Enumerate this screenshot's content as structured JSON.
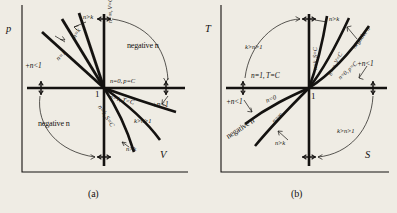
{
  "figure": {
    "background_color": "#efece4",
    "ink_color": "#141210"
  },
  "panels": [
    {
      "id": "a",
      "caption": "(a)",
      "y_axis_label": "p",
      "x_axis_label": "V",
      "origin_label": "1",
      "labels": [
        {
          "key": "n_gt_k_top",
          "text": "n>k"
        },
        {
          "key": "n_eq_k_upper",
          "text": "n=k"
        },
        {
          "key": "n_eq_1_upper",
          "text": "n=1"
        },
        {
          "key": "plus_n_lt_1_l",
          "text": "+n<1"
        },
        {
          "key": "v_axis_line",
          "text": "n=∞, V=C"
        },
        {
          "key": "negative_n_ur",
          "text": "negative n"
        },
        {
          "key": "n_eq_0",
          "text": "n=0, p=C"
        },
        {
          "key": "n_eq_1_lower",
          "text": "n=1, T=C"
        },
        {
          "key": "plus_n_lt_1_r",
          "text": "+n<1"
        },
        {
          "key": "k_gt_n_gt_1",
          "text": "k>n>1"
        },
        {
          "key": "n_eq_k_lower",
          "text": "n=k, S=C"
        },
        {
          "key": "n_gt_k_bottom",
          "text": "n>k"
        },
        {
          "key": "negative_n_ll",
          "text": "negative n"
        }
      ]
    },
    {
      "id": "b",
      "caption": "(b)",
      "y_axis_label": "T",
      "x_axis_label": "S",
      "origin_label": "1",
      "labels": [
        {
          "key": "k_gt_n_gt_1_ul",
          "text": "k>n>1"
        },
        {
          "key": "n_eq_k_axis",
          "text": "n=k, S=C"
        },
        {
          "key": "n_gt_k_top",
          "text": "n>k"
        },
        {
          "key": "n_inf_v_c",
          "text": "n=∞, V=C"
        },
        {
          "key": "negative_n_ur",
          "text": "negative n"
        },
        {
          "key": "n_eq_0_p_c",
          "text": "n=0, p=C"
        },
        {
          "key": "plus_n_lt_1_r",
          "text": "+n<1"
        },
        {
          "key": "n_eq_1_t_c",
          "text": "n=1, T=C"
        },
        {
          "key": "plus_n_lt_1_l",
          "text": "+n<1"
        },
        {
          "key": "n_eq_0_lower",
          "text": "n=0"
        },
        {
          "key": "negative_n_ll",
          "text": "negative n"
        },
        {
          "key": "n_inf_lower",
          "text": "n=∞"
        },
        {
          "key": "n_gt_k_bottom",
          "text": "n>k"
        },
        {
          "key": "k_gt_n_gt_1_lr",
          "text": "k>n>1"
        }
      ]
    }
  ]
}
